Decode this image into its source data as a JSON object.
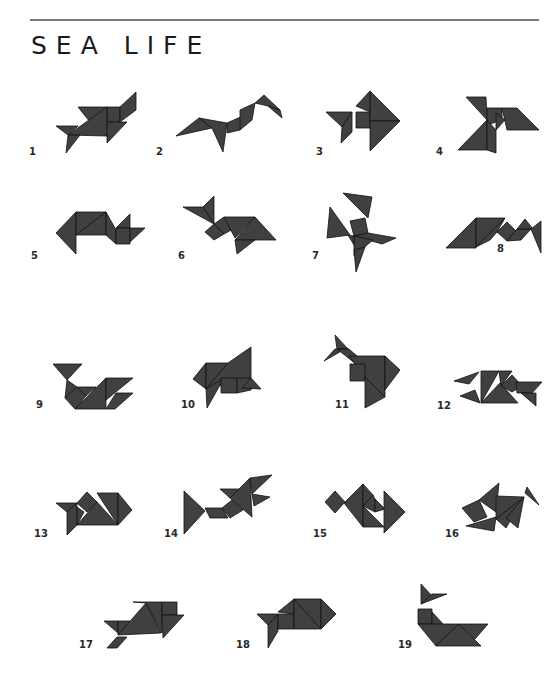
{
  "page": {
    "title": "SEA LIFE",
    "colors": {
      "shape_fill": "#404040",
      "shape_stroke": "#111111",
      "rule": "#7a7a7a",
      "text": "#1a1a1a"
    }
  },
  "figures": [
    {
      "number": "1"
    },
    {
      "number": "2"
    },
    {
      "number": "3"
    },
    {
      "number": "4"
    },
    {
      "number": "5"
    },
    {
      "number": "6"
    },
    {
      "number": "7"
    },
    {
      "number": "8"
    },
    {
      "number": "9"
    },
    {
      "number": "10"
    },
    {
      "number": "11"
    },
    {
      "number": "12"
    },
    {
      "number": "13"
    },
    {
      "number": "14"
    },
    {
      "number": "15"
    },
    {
      "number": "16"
    },
    {
      "number": "17"
    },
    {
      "number": "18"
    },
    {
      "number": "19"
    }
  ]
}
